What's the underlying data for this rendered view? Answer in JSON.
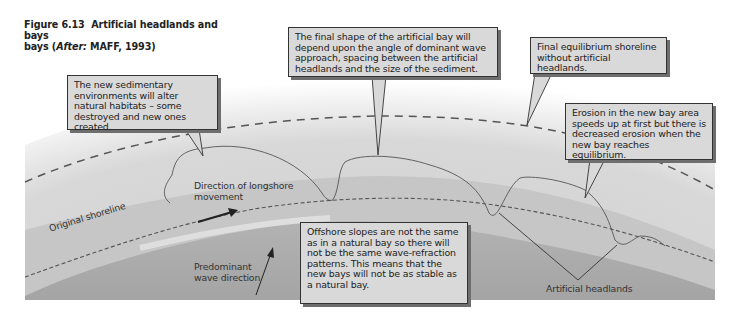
{
  "figure": {
    "number": "Figure 6.13",
    "title_main": "Artificial headlands and bays",
    "title_prefix": "bays (",
    "after_label": "After:",
    "source": " MAFF, 1993)"
  },
  "callouts": {
    "habitats": "The new sedimentary environments will alter natural habitats – some destroyed and new ones created.",
    "final_shape": "The final shape of the artificial bay will depend upon the angle of dominant wave approach, spacing between the artificial headlands and the size of the sediment.",
    "equilibrium": "Final equilibrium shoreline without artificial headlands.",
    "erosion": "Erosion in the new bay area speeds up at first but there is decreased erosion when the new bay reaches equilibrium.",
    "offshore": "Offshore slopes are not the same as in a natural bay so there will not be the same wave-refraction patterns. This means that the new bays will not be as stable as a natural bay."
  },
  "labels": {
    "longshore": "Direction of longshore movement",
    "original_shoreline": "Original shoreline",
    "wave_direction": "Predominant wave direction",
    "headlands": "Artificial headlands"
  },
  "colors": {
    "land": "#d8d8d8",
    "shallow": "#c4c4c4",
    "sea": "#a9a9a9",
    "callout_bg": "#d9d9d9",
    "line": "#444444"
  }
}
